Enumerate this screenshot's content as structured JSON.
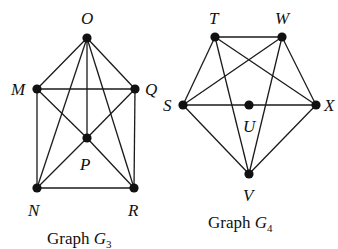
{
  "graphs": [
    {
      "id": "G3",
      "caption": {
        "prefix": "Graph ",
        "name": "G",
        "subscript": "3"
      },
      "vertices": [
        {
          "id": "O",
          "label": "O",
          "x": 87,
          "y": 38,
          "lx": 81,
          "ly": 24
        },
        {
          "id": "M",
          "label": "M",
          "x": 37,
          "y": 89,
          "lx": 11,
          "ly": 95
        },
        {
          "id": "Q",
          "label": "Q",
          "x": 135,
          "y": 89,
          "lx": 145,
          "ly": 95
        },
        {
          "id": "P",
          "label": "P",
          "x": 87,
          "y": 138,
          "lx": 80,
          "ly": 170
        },
        {
          "id": "N",
          "label": "N",
          "x": 37,
          "y": 188,
          "lx": 28,
          "ly": 216
        },
        {
          "id": "R",
          "label": "R",
          "x": 134,
          "y": 188,
          "lx": 128,
          "ly": 216
        }
      ],
      "edges": [
        [
          "O",
          "M"
        ],
        [
          "O",
          "Q"
        ],
        [
          "O",
          "N"
        ],
        [
          "O",
          "P"
        ],
        [
          "O",
          "R"
        ],
        [
          "M",
          "Q"
        ],
        [
          "M",
          "N"
        ],
        [
          "M",
          "P"
        ],
        [
          "P",
          "R"
        ],
        [
          "Q",
          "P"
        ],
        [
          "P",
          "N"
        ],
        [
          "Q",
          "R"
        ],
        [
          "N",
          "R"
        ]
      ],
      "caption_pos": {
        "x": 47,
        "y": 244
      }
    },
    {
      "id": "G4",
      "caption": {
        "prefix": "Graph ",
        "name": "G",
        "subscript": "4"
      },
      "vertices": [
        {
          "id": "T",
          "label": "T",
          "x": 215,
          "y": 37,
          "lx": 209,
          "ly": 24
        },
        {
          "id": "W",
          "label": "W",
          "x": 282,
          "y": 37,
          "lx": 275,
          "ly": 24
        },
        {
          "id": "S",
          "label": "S",
          "x": 183,
          "y": 105,
          "lx": 163,
          "ly": 111
        },
        {
          "id": "U",
          "label": "U",
          "x": 249,
          "y": 105,
          "lx": 243,
          "ly": 132
        },
        {
          "id": "X",
          "label": "X",
          "x": 316,
          "y": 105,
          "lx": 324,
          "ly": 111
        },
        {
          "id": "V",
          "label": "V",
          "x": 249,
          "y": 174,
          "lx": 243,
          "ly": 201
        }
      ],
      "edges": [
        [
          "T",
          "W"
        ],
        [
          "T",
          "S"
        ],
        [
          "T",
          "X"
        ],
        [
          "T",
          "V"
        ],
        [
          "W",
          "S"
        ],
        [
          "W",
          "X"
        ],
        [
          "W",
          "V"
        ],
        [
          "S",
          "U"
        ],
        [
          "U",
          "X"
        ],
        [
          "S",
          "V"
        ],
        [
          "X",
          "V"
        ]
      ],
      "caption_pos": {
        "x": 208,
        "y": 228
      }
    }
  ]
}
